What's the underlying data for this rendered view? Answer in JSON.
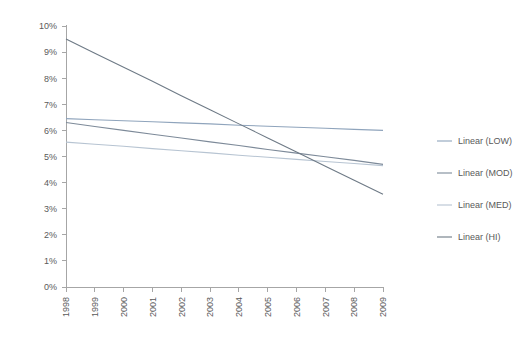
{
  "chart_data": {
    "type": "line",
    "title": "",
    "subtitle": "",
    "xlabel": "",
    "ylabel": "",
    "x": [
      1998,
      1999,
      2000,
      2001,
      2002,
      2003,
      2004,
      2005,
      2006,
      2007,
      2008,
      2009
    ],
    "xtick_labels": [
      "1998",
      "1999",
      "2000",
      "2001",
      "2002",
      "2003",
      "2004",
      "2005",
      "2006",
      "2007",
      "2008",
      "2009"
    ],
    "ytick_labels": [
      "0%",
      "1%",
      "2%",
      "3%",
      "4%",
      "5%",
      "6%",
      "7%",
      "8%",
      "9%",
      "10%"
    ],
    "ytick_values": [
      0,
      1,
      2,
      3,
      4,
      5,
      6,
      7,
      8,
      9,
      10
    ],
    "ylim": [
      0,
      10
    ],
    "xlim": [
      1998,
      2009
    ],
    "grid": false,
    "legend_position": "right",
    "series": [
      {
        "name": "Linear (LOW)",
        "color": "#8FA4BC",
        "start_value": 6.45,
        "end_value": 6.0,
        "values": [
          6.45,
          6.41,
          6.37,
          6.33,
          6.29,
          6.25,
          6.2,
          6.16,
          6.12,
          6.08,
          6.04,
          6.0
        ]
      },
      {
        "name": "Linear (MOD)",
        "color": "#7D8A99",
        "start_value": 6.3,
        "end_value": 4.7,
        "values": [
          6.3,
          6.15,
          6.0,
          5.85,
          5.71,
          5.56,
          5.42,
          5.27,
          5.13,
          4.99,
          4.85,
          4.7
        ]
      },
      {
        "name": "Linear (MED)",
        "color": "#B7C4D2",
        "start_value": 5.55,
        "end_value": 4.65,
        "values": [
          5.55,
          5.47,
          5.39,
          5.3,
          5.22,
          5.14,
          5.05,
          4.97,
          4.89,
          4.81,
          4.73,
          4.65
        ]
      },
      {
        "name": "Linear (HI)",
        "color": "#6E7A86",
        "start_value": 9.5,
        "end_value": 3.55,
        "values": [
          9.5,
          8.96,
          8.42,
          7.88,
          7.33,
          6.79,
          6.25,
          5.71,
          5.17,
          4.63,
          4.09,
          3.55
        ]
      }
    ]
  }
}
